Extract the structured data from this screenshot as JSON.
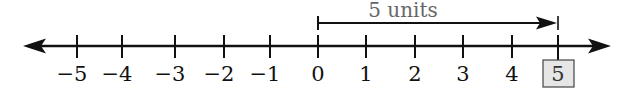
{
  "diagram": {
    "type": "number_line",
    "range": [
      -5,
      5
    ],
    "colors": {
      "line": "#111111",
      "measure_label": "#666666",
      "highlight_fill": "#e6e6e6",
      "highlight_stroke": "#444444"
    },
    "ticks": [
      {
        "value": -5,
        "label": "−5",
        "x": 77
      },
      {
        "value": -4,
        "label": "−4",
        "x": 122
      },
      {
        "value": -3,
        "label": "−3",
        "x": 175
      },
      {
        "value": -2,
        "label": "−2",
        "x": 224
      },
      {
        "value": -1,
        "label": "−1",
        "x": 270
      },
      {
        "value": 0,
        "label": "0",
        "x": 318
      },
      {
        "value": 1,
        "label": "1",
        "x": 366
      },
      {
        "value": 2,
        "label": "2",
        "x": 415
      },
      {
        "value": 3,
        "label": "3",
        "x": 463
      },
      {
        "value": 4,
        "label": "4",
        "x": 512
      },
      {
        "value": 5,
        "label": "5",
        "x": 558,
        "highlighted": true
      }
    ],
    "measure": {
      "from": 0,
      "to": 5,
      "label": "5 units"
    },
    "highlighted_value": "5"
  }
}
